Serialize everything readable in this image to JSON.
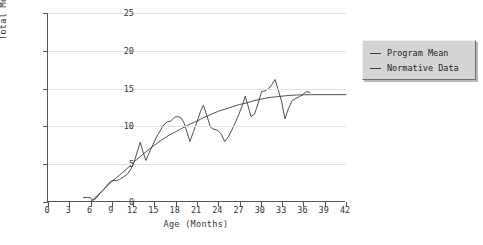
{
  "chart_data": {
    "type": "line",
    "title": "",
    "xlabel": "Age (Months)",
    "ylabel": "Total Movement Graph",
    "xlim": [
      0,
      42
    ],
    "ylim": [
      0,
      25
    ],
    "xticks": [
      0,
      3,
      6,
      9,
      12,
      15,
      18,
      21,
      24,
      27,
      30,
      33,
      36,
      39,
      42
    ],
    "yticks": [
      0,
      5,
      10,
      15,
      20,
      25
    ],
    "grid": "horizontal",
    "legend_position": "right-outside",
    "series": [
      {
        "name": "Program Mean",
        "color": "#3a3a3a",
        "points": [
          [
            5.0,
            0.6
          ],
          [
            5.6,
            0.6
          ],
          [
            6.0,
            0.55
          ],
          [
            6.3,
            0.2
          ],
          [
            6.8,
            0.5
          ],
          [
            7.3,
            1.1
          ],
          [
            7.8,
            1.6
          ],
          [
            8.3,
            2.2
          ],
          [
            8.8,
            2.7
          ],
          [
            9.2,
            2.9
          ],
          [
            9.6,
            2.8
          ],
          [
            10.1,
            3.0
          ],
          [
            10.6,
            3.3
          ],
          [
            11.1,
            3.6
          ],
          [
            11.6,
            4.2
          ],
          [
            12.1,
            5.2
          ],
          [
            12.5,
            6.4
          ],
          [
            13.0,
            7.9
          ],
          [
            13.4,
            6.6
          ],
          [
            13.8,
            5.5
          ],
          [
            14.3,
            6.6
          ],
          [
            14.8,
            7.6
          ],
          [
            15.3,
            8.6
          ],
          [
            15.8,
            9.4
          ],
          [
            16.3,
            10.2
          ],
          [
            16.8,
            10.6
          ],
          [
            17.3,
            10.7
          ],
          [
            17.8,
            11.2
          ],
          [
            18.3,
            11.3
          ],
          [
            18.8,
            11.1
          ],
          [
            19.2,
            10.4
          ],
          [
            19.6,
            9.2
          ],
          [
            20.0,
            8.0
          ],
          [
            20.5,
            9.3
          ],
          [
            21.0,
            10.6
          ],
          [
            21.5,
            12.0
          ],
          [
            21.9,
            12.8
          ],
          [
            22.4,
            11.4
          ],
          [
            22.9,
            9.9
          ],
          [
            23.4,
            9.6
          ],
          [
            23.9,
            9.5
          ],
          [
            24.4,
            9.0
          ],
          [
            24.9,
            8.0
          ],
          [
            25.4,
            8.6
          ],
          [
            25.9,
            9.5
          ],
          [
            26.4,
            10.5
          ],
          [
            26.9,
            11.6
          ],
          [
            27.4,
            12.8
          ],
          [
            27.8,
            14.0
          ],
          [
            28.2,
            12.7
          ],
          [
            28.6,
            11.3
          ],
          [
            29.1,
            11.6
          ],
          [
            29.6,
            13.0
          ],
          [
            30.1,
            14.6
          ],
          [
            30.6,
            14.7
          ],
          [
            31.1,
            15.0
          ],
          [
            31.6,
            15.6
          ],
          [
            32.0,
            16.2
          ],
          [
            32.4,
            15.0
          ],
          [
            32.9,
            13.4
          ],
          [
            33.4,
            11.0
          ],
          [
            33.9,
            12.4
          ],
          [
            34.4,
            13.4
          ],
          [
            34.9,
            13.7
          ],
          [
            35.4,
            13.9
          ],
          [
            35.9,
            14.2
          ],
          [
            36.4,
            14.6
          ],
          [
            36.9,
            14.5
          ]
        ]
      },
      {
        "name": "Normative Data",
        "color": "#3a3a3a",
        "points": [
          [
            6.0,
            0.05
          ],
          [
            6.5,
            0.45
          ],
          [
            7.0,
            0.9
          ],
          [
            7.5,
            1.35
          ],
          [
            8.0,
            1.8
          ],
          [
            8.5,
            2.25
          ],
          [
            9.0,
            2.7
          ],
          [
            9.5,
            3.1
          ],
          [
            10.0,
            3.5
          ],
          [
            10.5,
            3.9
          ],
          [
            11.0,
            4.3
          ],
          [
            11.5,
            4.75
          ],
          [
            12.0,
            5.2
          ],
          [
            12.5,
            5.6
          ],
          [
            13.0,
            6.0
          ],
          [
            13.5,
            6.4
          ],
          [
            14.0,
            6.8
          ],
          [
            14.5,
            7.15
          ],
          [
            15.0,
            7.5
          ],
          [
            15.5,
            7.85
          ],
          [
            16.0,
            8.2
          ],
          [
            16.5,
            8.5
          ],
          [
            17.0,
            8.8
          ],
          [
            17.5,
            9.05
          ],
          [
            18.0,
            9.3
          ],
          [
            18.5,
            9.55
          ],
          [
            19.0,
            9.8
          ],
          [
            19.5,
            10.05
          ],
          [
            20.0,
            10.3
          ],
          [
            20.5,
            10.5
          ],
          [
            21.0,
            10.7
          ],
          [
            21.5,
            10.95
          ],
          [
            22.0,
            11.2
          ],
          [
            22.5,
            11.4
          ],
          [
            23.0,
            11.6
          ],
          [
            23.5,
            11.8
          ],
          [
            24.0,
            12.0
          ],
          [
            24.5,
            12.15
          ],
          [
            25.0,
            12.3
          ],
          [
            25.5,
            12.45
          ],
          [
            26.0,
            12.6
          ],
          [
            26.5,
            12.75
          ],
          [
            27.0,
            12.9
          ],
          [
            27.5,
            13.0
          ],
          [
            28.0,
            13.1
          ],
          [
            28.5,
            13.25
          ],
          [
            29.0,
            13.4
          ],
          [
            29.5,
            13.5
          ],
          [
            30.0,
            13.6
          ],
          [
            30.5,
            13.7
          ],
          [
            31.0,
            13.8
          ],
          [
            31.5,
            13.85
          ],
          [
            32.0,
            13.9
          ],
          [
            32.5,
            13.95
          ],
          [
            33.0,
            14.0
          ],
          [
            33.5,
            14.05
          ],
          [
            34.0,
            14.1
          ],
          [
            34.5,
            14.12
          ],
          [
            35.0,
            14.15
          ],
          [
            36.0,
            14.18
          ],
          [
            37.0,
            14.2
          ],
          [
            38.0,
            14.2
          ],
          [
            39.0,
            14.2
          ],
          [
            40.0,
            14.2
          ],
          [
            41.0,
            14.2
          ],
          [
            42.0,
            14.2
          ]
        ]
      }
    ]
  },
  "legend": {
    "entries": [
      {
        "label": "Program Mean"
      },
      {
        "label": "Normative Data"
      }
    ]
  }
}
